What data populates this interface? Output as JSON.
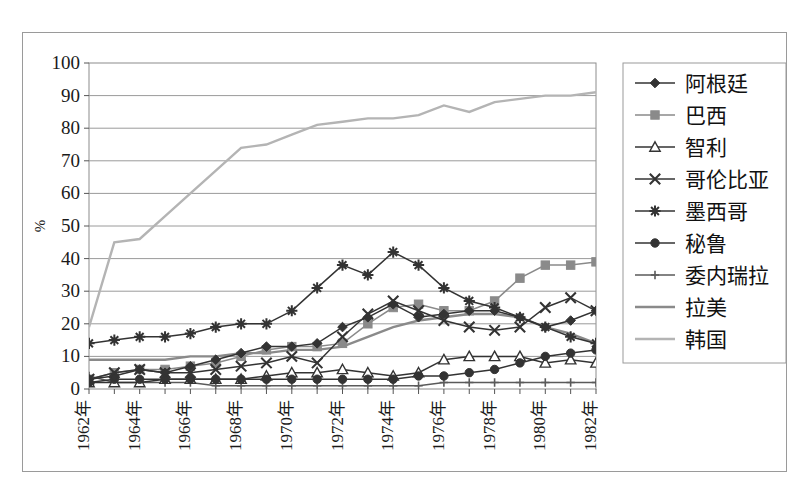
{
  "chart_data": {
    "type": "line",
    "title": "",
    "xlabel": "",
    "ylabel": "%",
    "ylim": [
      0,
      100
    ],
    "ytick_values": [
      0,
      10,
      20,
      30,
      40,
      50,
      60,
      70,
      80,
      90,
      100
    ],
    "ytick_labels": [
      "0",
      "10",
      "20",
      "30",
      "40",
      "50",
      "60",
      "70",
      "80",
      "90",
      "100"
    ],
    "grid": true,
    "legend_position": "right",
    "x": [
      1962,
      1963,
      1964,
      1965,
      1966,
      1967,
      1968,
      1969,
      1970,
      1971,
      1972,
      1973,
      1974,
      1975,
      1976,
      1977,
      1978,
      1979,
      1980,
      1981,
      1982
    ],
    "xtick_labels": [
      "1962年",
      "1964年",
      "1966年",
      "1968年",
      "1970年",
      "1972年",
      "1974年",
      "1976年",
      "1978年",
      "1980年",
      "1982年"
    ],
    "xtick_values": [
      1962,
      1964,
      1966,
      1968,
      1970,
      1972,
      1974,
      1976,
      1978,
      1980,
      1982
    ],
    "series": [
      {
        "name": "阿根廷",
        "marker": "diamond",
        "color": "#333333",
        "values": [
          3,
          4,
          6,
          5,
          7,
          9,
          11,
          13,
          13,
          14,
          19,
          22,
          26,
          22,
          23,
          24,
          24,
          22,
          19,
          21,
          24
        ]
      },
      {
        "name": "巴西",
        "marker": "square",
        "color": "#8a8a8a",
        "values": [
          3,
          5,
          6,
          6,
          7,
          8,
          10,
          12,
          13,
          13,
          14,
          20,
          25,
          26,
          24,
          24,
          27,
          34,
          38,
          38,
          39
        ]
      },
      {
        "name": "智利",
        "marker": "triangle",
        "color": "#333333",
        "values": [
          2,
          2,
          2,
          3,
          3,
          3,
          3,
          4,
          5,
          5,
          6,
          5,
          4,
          5,
          9,
          10,
          10,
          10,
          8,
          9,
          8
        ]
      },
      {
        "name": "哥伦比亚",
        "marker": "x",
        "color": "#333333",
        "values": [
          3,
          5,
          6,
          5,
          5,
          6,
          7,
          8,
          10,
          8,
          16,
          23,
          27,
          24,
          21,
          19,
          18,
          19,
          25,
          28,
          24
        ]
      },
      {
        "name": "墨西哥",
        "marker": "asterisk",
        "color": "#333333",
        "values": [
          14,
          15,
          16,
          16,
          17,
          19,
          20,
          20,
          24,
          31,
          38,
          35,
          42,
          38,
          31,
          27,
          25,
          22,
          19,
          16,
          14
        ]
      },
      {
        "name": "秘鲁",
        "marker": "circle",
        "color": "#333333",
        "values": [
          2,
          3,
          3,
          3,
          3,
          3,
          3,
          3,
          3,
          3,
          3,
          3,
          3,
          4,
          4,
          5,
          6,
          8,
          10,
          11,
          12
        ]
      },
      {
        "name": "委内瑞拉",
        "marker": "plus",
        "color": "#5a5a5a",
        "values": [
          4,
          2,
          2,
          2,
          2,
          1,
          1,
          1,
          1,
          1,
          1,
          1,
          1,
          1,
          2,
          2,
          2,
          2,
          2,
          2,
          2
        ]
      },
      {
        "name": "拉美",
        "marker": "none",
        "color": "#8a8a8a",
        "values": [
          9,
          9,
          9,
          9,
          10,
          10,
          11,
          11,
          12,
          12,
          13,
          16,
          19,
          21,
          22,
          23,
          23,
          22,
          19,
          17,
          14
        ]
      },
      {
        "name": "韩国",
        "marker": "none",
        "color": "#b4b4b4",
        "values": [
          19,
          45,
          46,
          53,
          60,
          67,
          74,
          75,
          78,
          81,
          82,
          83,
          83,
          84,
          87,
          85,
          88,
          89,
          90,
          90,
          91
        ]
      }
    ]
  },
  "legend": {
    "items": [
      {
        "label": "阿根廷"
      },
      {
        "label": "巴西"
      },
      {
        "label": "智利"
      },
      {
        "label": "哥伦比亚"
      },
      {
        "label": "墨西哥"
      },
      {
        "label": "秘鲁"
      },
      {
        "label": "委内瑞拉"
      },
      {
        "label": "拉美"
      },
      {
        "label": "韩国"
      }
    ]
  }
}
